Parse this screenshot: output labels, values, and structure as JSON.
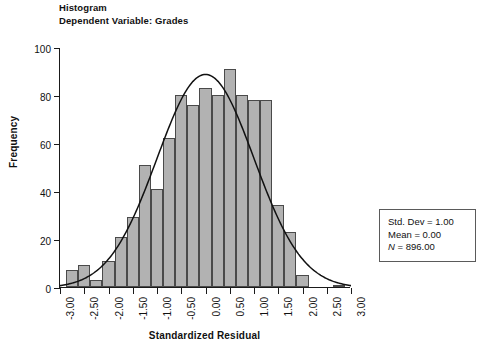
{
  "titles": {
    "line1": "Histogram",
    "line2": "Dependent Variable: Grades"
  },
  "axes": {
    "xlabel": "Standardized Residual",
    "ylabel": "Frequency",
    "ytick_labels": [
      "0",
      "20",
      "40",
      "60",
      "80",
      "100"
    ],
    "xtick_labels": [
      "-3.00",
      "-2.50",
      "-2.00",
      "-1.50",
      "-1.00",
      "-0.50",
      "0.00",
      "0.50",
      "1.00",
      "1.50",
      "2.00",
      "2.50",
      "3.00"
    ]
  },
  "stats": {
    "std_dev": "Std. Dev = 1.00",
    "mean": "Mean = 0.00",
    "n_italic": "N",
    "n_rest": " = 896.00"
  },
  "style": {
    "bar_fill": "#b2b2b2",
    "bar_stroke": "#4a4a4a",
    "axis_color": "#1a1a1a",
    "curve_color": "#111111",
    "box_stroke": "#5a5a5a"
  },
  "chart_data": {
    "type": "bar",
    "xlabel": "Standardized Residual",
    "ylabel": "Frequency",
    "xlim": [
      -3.0,
      3.0
    ],
    "ylim": [
      0,
      100
    ],
    "ytick_values": [
      0,
      20,
      40,
      60,
      80,
      100
    ],
    "xtick_values": [
      -3.0,
      -2.5,
      -2.0,
      -1.5,
      -1.0,
      -0.5,
      0.0,
      0.5,
      1.0,
      1.5,
      2.0,
      2.5,
      3.0
    ],
    "grid": false,
    "legend": null,
    "bin_width": 0.25,
    "bin_centers": [
      -2.75,
      -2.5,
      -2.25,
      -2.0,
      -1.75,
      -1.5,
      -1.25,
      -1.0,
      -0.75,
      -0.5,
      -0.25,
      0.0,
      0.25,
      0.5,
      0.75,
      1.0,
      1.25,
      1.5,
      1.75,
      2.0,
      2.75
    ],
    "values": [
      7,
      9,
      3,
      11,
      21,
      29,
      51,
      41,
      62,
      80,
      76,
      83,
      80,
      91,
      80,
      78,
      78,
      34,
      23,
      5,
      1
    ],
    "overlay": {
      "type": "line",
      "name": "normal curve",
      "mean": 0.0,
      "std_dev": 1.0,
      "n": 896,
      "peak_value": 89
    },
    "annotations": [
      "Std. Dev = 1.00",
      "Mean = 0.00",
      "N = 896.00"
    ]
  }
}
